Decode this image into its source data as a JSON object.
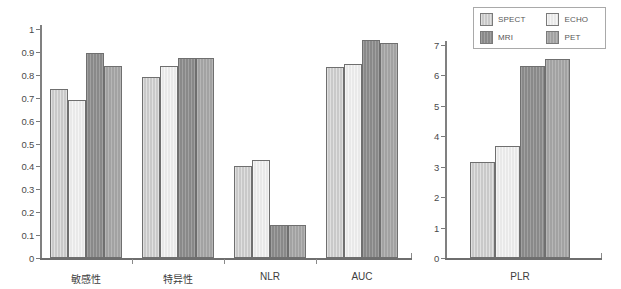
{
  "chart_data": [
    {
      "type": "bar",
      "id": "left-panel",
      "title": "",
      "xlabel": "",
      "ylabel": "",
      "ylim": [
        0,
        1
      ],
      "yticks": [
        "0",
        "0.1",
        "0.2",
        "0.3",
        "0.4",
        "0.5",
        "0.6",
        "0.7",
        "0.8",
        "0.9",
        "1"
      ],
      "ytick_values": [
        0,
        0.1,
        0.2,
        0.3,
        0.4,
        0.5,
        0.6,
        0.7,
        0.8,
        0.9,
        1
      ],
      "grid": false,
      "categories": [
        "敏感性",
        "特异性",
        "NLR",
        "AUC"
      ],
      "series": [
        {
          "name": "SPECT",
          "values": [
            0.74,
            0.79,
            0.4,
            0.835
          ]
        },
        {
          "name": "ECHO",
          "values": [
            0.69,
            0.84,
            0.43,
            0.845
          ]
        },
        {
          "name": "MRI",
          "values": [
            0.895,
            0.872,
            0.145,
            0.95
          ]
        },
        {
          "name": "PET",
          "values": [
            0.84,
            0.872,
            0.145,
            0.94
          ]
        }
      ]
    },
    {
      "type": "bar",
      "id": "right-panel",
      "title": "",
      "xlabel": "",
      "ylabel": "",
      "ylim": [
        0,
        7
      ],
      "yticks": [
        "0",
        "1",
        "2",
        "3",
        "4",
        "5",
        "6",
        "7"
      ],
      "ytick_values": [
        0,
        1,
        2,
        3,
        4,
        5,
        6,
        7
      ],
      "grid": false,
      "categories": [
        "PLR"
      ],
      "series": [
        {
          "name": "SPECT",
          "values": [
            3.15
          ]
        },
        {
          "name": "ECHO",
          "values": [
            3.68
          ]
        },
        {
          "name": "MRI",
          "values": [
            6.3
          ]
        },
        {
          "name": "PET",
          "values": [
            6.55
          ]
        }
      ]
    }
  ],
  "legend": {
    "position": "top-right",
    "entries": [
      {
        "label": "SPECT",
        "key": "s-spect",
        "color": "#c9c9c9"
      },
      {
        "label": "ECHO",
        "key": "s-echo",
        "color": "#e9e9e9"
      },
      {
        "label": "MRI",
        "key": "s-mri",
        "color": "#898989"
      },
      {
        "label": "PET",
        "key": "s-pet",
        "color": "#a2a2a2"
      }
    ]
  },
  "style": {
    "axis_color": "#7a7a7a",
    "bar_border": "#6f6f6f",
    "background": "#ffffff",
    "text_color": "#3d3d3d"
  }
}
